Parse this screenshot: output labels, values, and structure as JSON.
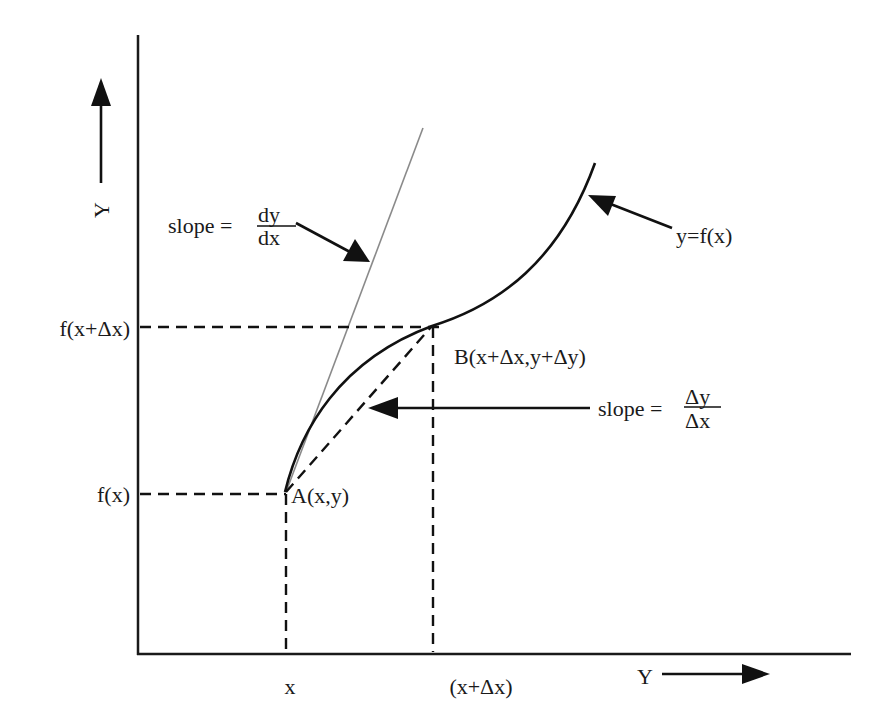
{
  "diagram": {
    "type": "derivative-illustration",
    "y_axis_label": "Y",
    "x_axis_label": "Y",
    "curve_label": "y=f(x)",
    "tangent_slope": {
      "prefix": "slope =",
      "numerator": "dy",
      "denominator": "dx"
    },
    "secant_slope": {
      "prefix": "slope =",
      "numerator": "Δy",
      "denominator": "Δx"
    },
    "point_a": "A(x,y)",
    "point_b": "B(x+Δx,y+Δy)",
    "y_ticks": [
      "f(x+Δx)",
      "f(x)"
    ],
    "x_ticks": [
      "x",
      "(x+Δx)"
    ]
  },
  "colors": {
    "ink": "#111111",
    "tangent": "#8a8a8a",
    "background": "#ffffff"
  }
}
